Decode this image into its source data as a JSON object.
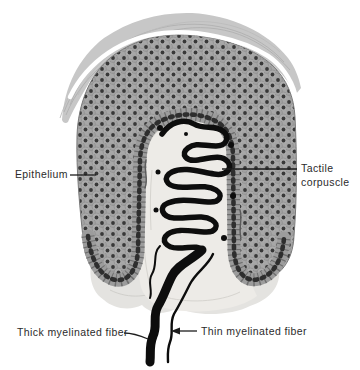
{
  "figure": {
    "labels": {
      "epithelium": "Epithelium",
      "tactile_line1": "Tactile",
      "tactile_line2": "corpuscle",
      "thick_fiber": "Thick myelinated fiber",
      "thin_fiber": "Thin myelinated fiber"
    },
    "colors": {
      "background": "#ffffff",
      "text": "#2b2b2b",
      "leader": "#1d1d1d",
      "cap": "#c7c7c7",
      "epithelium": "#a7a7a7",
      "nucleus": "#383838",
      "papilla": "#edebe7",
      "tissue": "#e4e3e0",
      "nerve": "#0d0d0d"
    }
  }
}
